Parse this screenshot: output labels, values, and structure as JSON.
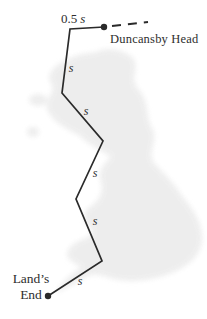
{
  "figure_type": "displacement-path-diagram",
  "colors": {
    "background": "#ffffff",
    "map_fill": "#ececec",
    "path_stroke": "#2a2a2a",
    "text": "#2e2e2e"
  },
  "labels": {
    "half_segment_value": "0.5",
    "half_segment_symbol": "s",
    "end_point": "Duncansby Head",
    "start_line1": "Land’s",
    "start_line2": "End"
  },
  "diagram": {
    "route_points": [
      [
        104,
        27
      ],
      [
        70,
        29
      ],
      [
        62,
        93
      ],
      [
        103,
        141
      ],
      [
        76,
        199
      ],
      [
        102,
        261
      ],
      [
        48,
        296
      ]
    ],
    "dashed_line": [
      112,
      26,
      148,
      22
    ],
    "dot_radius": 3.2,
    "segment_labels": [
      {
        "text": "s",
        "x": 71,
        "y": 68
      },
      {
        "text": "s",
        "x": 86,
        "y": 111
      },
      {
        "text": "s",
        "x": 95,
        "y": 173
      },
      {
        "text": "s",
        "x": 95,
        "y": 221
      },
      {
        "text": "s",
        "x": 80,
        "y": 281
      }
    ]
  }
}
